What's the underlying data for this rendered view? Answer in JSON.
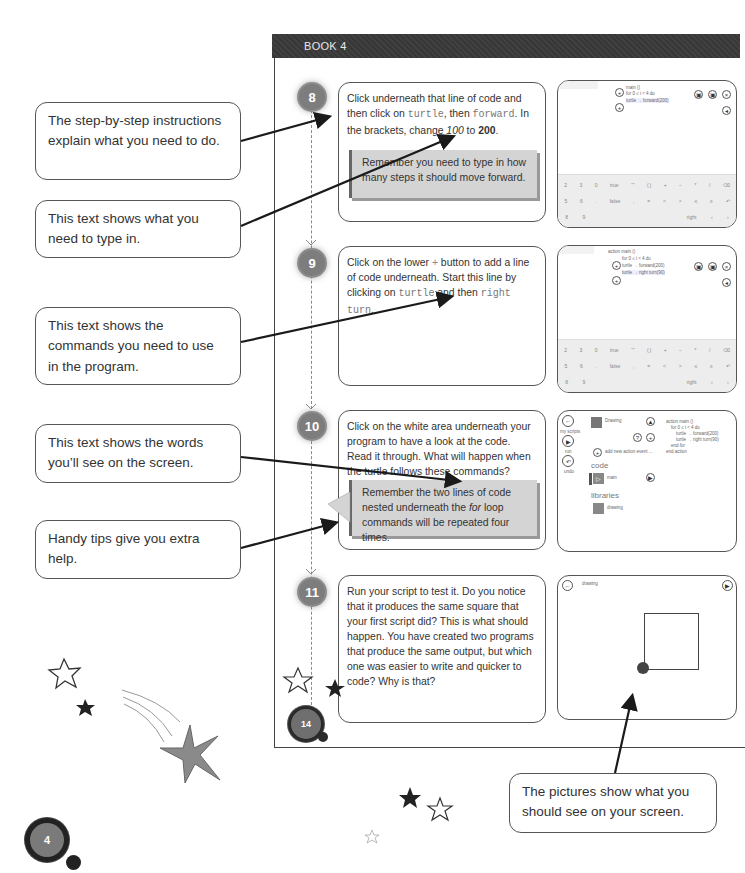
{
  "header": {
    "book_label": "BOOK 4"
  },
  "steps": [
    {
      "number": "8",
      "text_parts": [
        "Click underneath that line of code and then click on ",
        "turtle",
        ", then ",
        "forward",
        ". In the brackets, change ",
        "100",
        " to ",
        "200",
        "."
      ],
      "tip": "Remember you need to type in how many steps it should move forward."
    },
    {
      "number": "9",
      "text_parts": [
        "Click on the lower ",
        "+",
        " button to add a line of code underneath. Start this line by clicking on ",
        "turtle",
        " and then ",
        "right turn",
        "."
      ]
    },
    {
      "number": "10",
      "text": "Click on the white area underneath your program to have a look at the code. Read it through. What will happen when the turtle follows these commands?",
      "tip_parts": [
        "Remember the two lines of code nested underneath the ",
        "for",
        " loop commands will be repeated four times."
      ]
    },
    {
      "number": "11",
      "text": "Run your script to test it. Do you notice that it produces the same square that your first script did? This is what should happen. You have created two programs that produce the same output, but which one was easier to write and quicker to code? Why is that?"
    }
  ],
  "screenshots": {
    "step8": {
      "code_lines": [
        "main ()",
        "for 0 ≤ i < 4 do",
        "turtle → forward(200)"
      ],
      "keyboard_rows": [
        [
          "2",
          "3",
          "0",
          "true",
          "“”",
          "( )",
          "+",
          "−",
          "*",
          "/",
          "⌫"
        ],
        [
          "5",
          "6",
          ".",
          "false",
          ",",
          "=",
          "<",
          ">",
          "≤",
          "≥",
          "↶"
        ],
        [
          "8",
          "9",
          "",
          "",
          "",
          "",
          "",
          "",
          "right",
          "‹",
          "›"
        ]
      ]
    },
    "step9": {
      "code_lines": [
        "action main ()",
        "for 0 ≤ i < 4 do",
        "turtle → forward(200)",
        "turtle → right turn(90)"
      ],
      "keyboard_rows": [
        [
          "2",
          "3",
          "0",
          "true",
          "“”",
          "( )",
          "+",
          "−",
          "*",
          "/",
          "⌫"
        ],
        [
          "5",
          "6",
          ".",
          "false",
          ",",
          "=",
          "<",
          ">",
          "≤",
          "≥",
          "↶"
        ],
        [
          "8",
          "9",
          "",
          "",
          "",
          "",
          "",
          "",
          "right",
          "‹",
          "›"
        ]
      ]
    },
    "step10": {
      "side_buttons": [
        "my scripts",
        "run",
        "undo"
      ],
      "script_title": "Drawing",
      "add_event_label": "add new action event ...",
      "section_code": "code",
      "code_item": "main",
      "section_libraries": "libraries",
      "library_item": "drawing",
      "code_lines": [
        "action main ()",
        "for 0 ≤ i < 4 do",
        "turtle → forward(200)",
        "turtle → right turn(90)",
        "end for",
        "end action"
      ]
    },
    "step11": {
      "label": "drawing"
    }
  },
  "callouts": [
    "The step-by-step instructions explain what you need to do.",
    "This text shows what you need to type in.",
    "This text shows the commands you need to use in the program.",
    "This text shows the words you’ll see on the screen.",
    "Handy tips give you extra help.",
    "The pictures show what you should see on your screen."
  ],
  "page_badges": {
    "inner_page": "14",
    "outer_page": "4"
  }
}
